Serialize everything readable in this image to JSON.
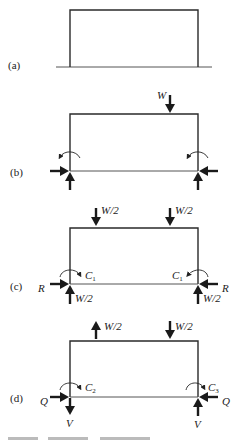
{
  "figure": {
    "panels": [
      {
        "id": "a",
        "label": "(a)"
      },
      {
        "id": "b",
        "label": "(b)",
        "loads": {
          "top": "W"
        }
      },
      {
        "id": "c",
        "label": "(c)",
        "loads": {
          "top_left": "W/2",
          "top_right": "W/2",
          "left_horizontal": "R",
          "right_horizontal": "R",
          "left_vertical": "W/2",
          "right_vertical": "W/2",
          "left_moment": "C",
          "left_moment_sub": "1",
          "right_moment": "C",
          "right_moment_sub": "1"
        }
      },
      {
        "id": "d",
        "label": "(d)",
        "loads": {
          "top_left": "W/2",
          "top_right": "W/2",
          "left_horizontal": "Q",
          "right_horizontal": "Q",
          "left_vertical": "V",
          "right_vertical": "V",
          "left_moment": "C",
          "left_moment_sub": "2",
          "right_moment": "C",
          "right_moment_sub": "3"
        }
      }
    ]
  },
  "colors": {
    "line": "#2a2a2a",
    "arrow": "#1a1a1a",
    "background": "#ffffff"
  }
}
